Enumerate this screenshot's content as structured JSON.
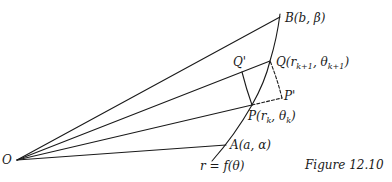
{
  "figure": {
    "caption": "Figure 12.10",
    "stroke_color": "#1a1a1a",
    "points": {
      "O": {
        "label": "O",
        "x": 17,
        "y": 160
      },
      "A": {
        "label": "A(a, α)",
        "x": 226,
        "y": 145
      },
      "P": {
        "label_main": "P(r",
        "label_sub1": "k",
        "label_mid": ", θ",
        "label_sub2": "k",
        "label_end": ")",
        "x": 252,
        "y": 105
      },
      "Q": {
        "label_main": "Q(r",
        "label_sub1": "k+1",
        "label_mid": ", θ",
        "label_sub2": "k+1",
        "label_end": ")",
        "x": 270,
        "y": 61
      },
      "B": {
        "label": "B(b, β)",
        "x": 280,
        "y": 17
      },
      "Qprime": {
        "label": "Q'",
        "x": 242,
        "y": 72
      },
      "Pprime": {
        "label": "P'",
        "x": 282,
        "y": 98
      }
    },
    "curve_label": "r = f(θ)"
  }
}
